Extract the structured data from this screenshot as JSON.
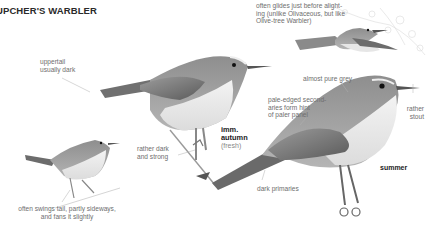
{
  "title": "UPCHER'S WARBLER",
  "annotations": {
    "glide_note": [
      "often glides just before alight-",
      "ing (unlike Olivaceous, but like",
      "Olive-tree Warbler)"
    ],
    "uppertail": [
      "uppertail",
      "usually dark"
    ],
    "almost_grey": "almost pure grey",
    "secondaries": [
      "pale-edged second-",
      "aries form hint",
      "of paler panel"
    ],
    "bill": [
      "rather",
      "stout"
    ],
    "legs": [
      "rather dark",
      "and strong"
    ],
    "primaries": "dark primaries",
    "tail_note": [
      "often swings tail, partly sideways,",
      "and fans it slightly"
    ]
  },
  "plumage_labels": {
    "imm_autumn": {
      "line1": "imm.",
      "line2": "autumn",
      "sub": "(fresh)"
    },
    "summer": "summer"
  },
  "figures": [
    {
      "name": "flying-bird",
      "pose": "gliding"
    },
    {
      "name": "imm-autumn-bird",
      "pose": "perched"
    },
    {
      "name": "summer-bird",
      "pose": "perched"
    },
    {
      "name": "small-bird",
      "pose": "perched, tail swung"
    }
  ]
}
